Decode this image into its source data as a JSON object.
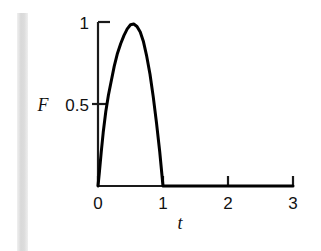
{
  "figure": {
    "background_color": "#ffffff",
    "curve_color": "#000000",
    "axis_color": "#1a1a1a",
    "gutter_color": "#d9d9d9"
  },
  "labels": {
    "y_axis_label": "F",
    "x_axis_label": "t",
    "y_tick_1": "1",
    "y_tick_0_5": "0.5",
    "x_tick_0": "0",
    "x_tick_1": "1",
    "x_tick_2": "2",
    "x_tick_3": "3"
  },
  "chart_data": {
    "type": "line",
    "title": "",
    "xlabel": "t",
    "ylabel": "F",
    "xlim": [
      0,
      3
    ],
    "ylim": [
      0,
      1.05
    ],
    "xticks": [
      0,
      1,
      2,
      3
    ],
    "xticklabels": [
      "0",
      "1",
      "2",
      "3"
    ],
    "yticks": [
      0.5,
      1
    ],
    "yticklabels": [
      "0.5",
      "1"
    ],
    "grid": false,
    "legend": null,
    "series": [
      {
        "name": "F(t)",
        "color": "#000000",
        "linewidth": 3,
        "x": [
          0.0,
          0.02,
          0.05,
          0.08,
          0.12,
          0.16,
          0.2,
          0.25,
          0.3,
          0.35,
          0.4,
          0.45,
          0.5,
          0.55,
          0.6,
          0.65,
          0.7,
          0.75,
          0.8,
          0.85,
          0.9,
          0.95,
          1.0,
          1.2,
          1.5,
          2.0,
          2.5,
          3.0
        ],
        "y": [
          0.0,
          0.08,
          0.21,
          0.33,
          0.46,
          0.56,
          0.64,
          0.74,
          0.82,
          0.88,
          0.93,
          0.97,
          0.995,
          1.0,
          0.985,
          0.95,
          0.89,
          0.8,
          0.69,
          0.55,
          0.39,
          0.21,
          0.0,
          0.0,
          0.0,
          0.0,
          0.0,
          0.0
        ]
      }
    ],
    "annotations": [
      {
        "text": "peak",
        "x": 0.55,
        "y": 1.0
      }
    ]
  },
  "geometry": {
    "origin_px": {
      "x": 98,
      "y": 186
    },
    "x_unit_px": 65,
    "y_half_unit_px": 81
  }
}
